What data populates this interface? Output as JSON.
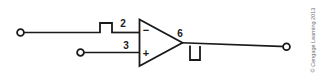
{
  "figure": {
    "background_color": "#ffffff",
    "line_color": "#1a1a1a"
  },
  "opamp": {
    "symbol": "triangle",
    "inverting_pin_number": "2",
    "inverting_polarity": "−",
    "noninverting_pin_number": "3",
    "noninverting_polarity": "+",
    "output_pin_number": "6"
  },
  "components": {
    "input_series_element": {
      "name": "resistor-box-input",
      "orientation": "horizontal-above-wire"
    },
    "output_shunt_element": {
      "name": "resistor-box-output",
      "orientation": "vertical-below-wire"
    }
  },
  "terminals": {
    "input_inverting": "open-circle-terminal",
    "input_noninverting": "open-circle-terminal",
    "output": "open-circle-terminal"
  },
  "credit": {
    "text": "© Cengage Learning 2013",
    "color": "#6e6e6e"
  }
}
